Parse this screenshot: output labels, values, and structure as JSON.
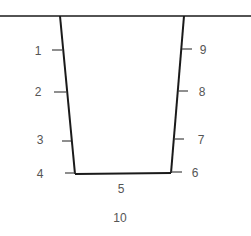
{
  "diagram": {
    "type": "trench cross-section (trapezoid)",
    "colors": {
      "line": "#1a1a1a",
      "tick": "#444444",
      "label": "#555555",
      "background": "#ffffff"
    },
    "ground_line": {
      "x1": 0,
      "y1": 16,
      "x2": 251,
      "y2": 16
    },
    "walls": {
      "left": {
        "x1": 60,
        "y1": 16,
        "x2": 75,
        "y2": 174
      },
      "bottom": {
        "x1": 75,
        "y1": 174,
        "x2": 171,
        "y2": 173
      },
      "right": {
        "x1": 184,
        "y1": 16,
        "x2": 171,
        "y2": 173
      }
    },
    "labels": [
      {
        "id": "1",
        "text": "1",
        "x": 38,
        "y": 55,
        "tick": {
          "x1": 52,
          "y1": 50,
          "x2": 62,
          "y2": 50
        }
      },
      {
        "id": "2",
        "text": "2",
        "x": 38,
        "y": 96,
        "tick": {
          "x1": 54,
          "y1": 92,
          "x2": 66,
          "y2": 92
        }
      },
      {
        "id": "3",
        "text": "3",
        "x": 40,
        "y": 144,
        "tick": {
          "x1": 62,
          "y1": 141,
          "x2": 71,
          "y2": 141
        }
      },
      {
        "id": "4",
        "text": "4",
        "x": 40,
        "y": 178,
        "tick": {
          "x1": 65,
          "y1": 173,
          "x2": 75,
          "y2": 173
        }
      },
      {
        "id": "5",
        "text": "5",
        "x": 121,
        "y": 193,
        "tick": null
      },
      {
        "id": "6",
        "text": "6",
        "x": 195,
        "y": 177,
        "tick": {
          "x1": 171,
          "y1": 172,
          "x2": 182,
          "y2": 172
        }
      },
      {
        "id": "7",
        "text": "7",
        "x": 201,
        "y": 144,
        "tick": {
          "x1": 174,
          "y1": 139,
          "x2": 184,
          "y2": 139
        }
      },
      {
        "id": "8",
        "text": "8",
        "x": 202,
        "y": 96,
        "tick": {
          "x1": 178,
          "y1": 91,
          "x2": 188,
          "y2": 91
        }
      },
      {
        "id": "9",
        "text": "9",
        "x": 203,
        "y": 54,
        "tick": {
          "x1": 182,
          "y1": 49,
          "x2": 192,
          "y2": 49
        }
      },
      {
        "id": "10",
        "text": "10",
        "x": 120,
        "y": 222,
        "tick": null
      }
    ]
  }
}
